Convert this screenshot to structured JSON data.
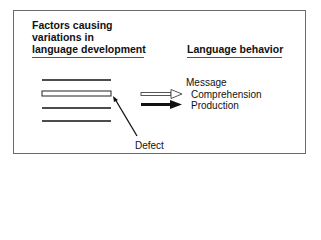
{
  "diagram": {
    "left_heading": {
      "lines": [
        "Factors causing",
        "variations in",
        "language development"
      ]
    },
    "right_heading": "Language behavior",
    "factor_bars": {
      "count": 4,
      "defective_index": 1
    },
    "defect_label": "Defect",
    "message_label": "Message",
    "comprehension_label": "Comprehension",
    "production_label": "Production",
    "arrows": [
      {
        "name": "comprehension-arrow",
        "style": "hollow"
      },
      {
        "name": "production-arrow",
        "style": "solid"
      }
    ],
    "colors": {
      "line": "#111111",
      "frame": "#6a6a6a",
      "background": "#ffffff"
    }
  }
}
